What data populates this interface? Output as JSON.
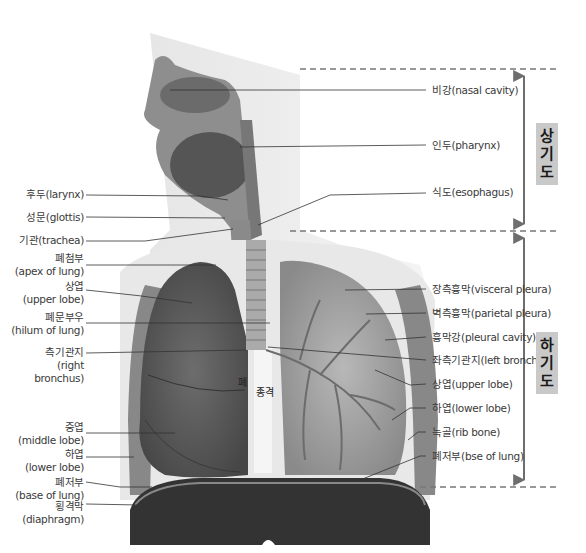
{
  "diagram": {
    "type": "anatomy-respiratory-system",
    "organ_labels": {
      "lung": "폐",
      "mediastinum": "종격"
    },
    "regions": [
      {
        "id": "upper",
        "label_chars": [
          "상",
          "기",
          "도"
        ],
        "label": "상기도"
      },
      {
        "id": "lower",
        "label_chars": [
          "하",
          "기",
          "도"
        ],
        "label": "하기도"
      }
    ],
    "left_labels": [
      {
        "id": "larynx",
        "lines": [
          "후두(larynx)"
        ]
      },
      {
        "id": "glottis",
        "lines": [
          "성문(glottis)"
        ]
      },
      {
        "id": "trachea",
        "lines": [
          "기관(trachea)"
        ]
      },
      {
        "id": "apex",
        "lines": [
          "폐첨부",
          "(apex of lung)"
        ]
      },
      {
        "id": "upper-lobe-r",
        "lines": [
          "상엽",
          "(upper lobe)"
        ]
      },
      {
        "id": "hilum",
        "lines": [
          "폐문부우",
          "(hilum of lung)"
        ]
      },
      {
        "id": "right-bronchus",
        "lines": [
          "측기관지",
          "(right",
          "bronchus)"
        ]
      },
      {
        "id": "middle-lobe",
        "lines": [
          "중엽",
          "(middle lobe)"
        ]
      },
      {
        "id": "lower-lobe-r",
        "lines": [
          "하엽",
          "(lower lobe)"
        ]
      },
      {
        "id": "base-r",
        "lines": [
          "폐저부",
          "(base of lung)"
        ]
      },
      {
        "id": "diaphragm",
        "lines": [
          "횡격막",
          "(diaphragm)"
        ]
      }
    ],
    "right_labels": [
      {
        "id": "nasal",
        "lines": [
          "비강(nasal cavity)"
        ]
      },
      {
        "id": "pharynx",
        "lines": [
          "인두(pharynx)"
        ]
      },
      {
        "id": "esophagus",
        "lines": [
          "식도(esophagus)"
        ]
      },
      {
        "id": "visceral",
        "lines": [
          "장측흉막(visceral pleura)"
        ]
      },
      {
        "id": "parietal",
        "lines": [
          "벽측흉막(parietal pleura)"
        ]
      },
      {
        "id": "cavity",
        "lines": [
          "흉막강(pleural cavity)"
        ]
      },
      {
        "id": "left-bronchus",
        "lines": [
          "좌측기관지(left bronchus)"
        ]
      },
      {
        "id": "upper-lobe-l",
        "lines": [
          "상엽(upper lobe)"
        ]
      },
      {
        "id": "lower-lobe-l",
        "lines": [
          "하엽(lower lobe)"
        ]
      },
      {
        "id": "rib",
        "lines": [
          "늑골(rib bone)"
        ]
      },
      {
        "id": "base-l",
        "lines": [
          "폐저부(bse of lung)"
        ]
      }
    ],
    "colors": {
      "line": "#333333",
      "dash": "#777777",
      "arrow": "#6e6e6e",
      "tag_bg": "#c9c9c9"
    }
  }
}
